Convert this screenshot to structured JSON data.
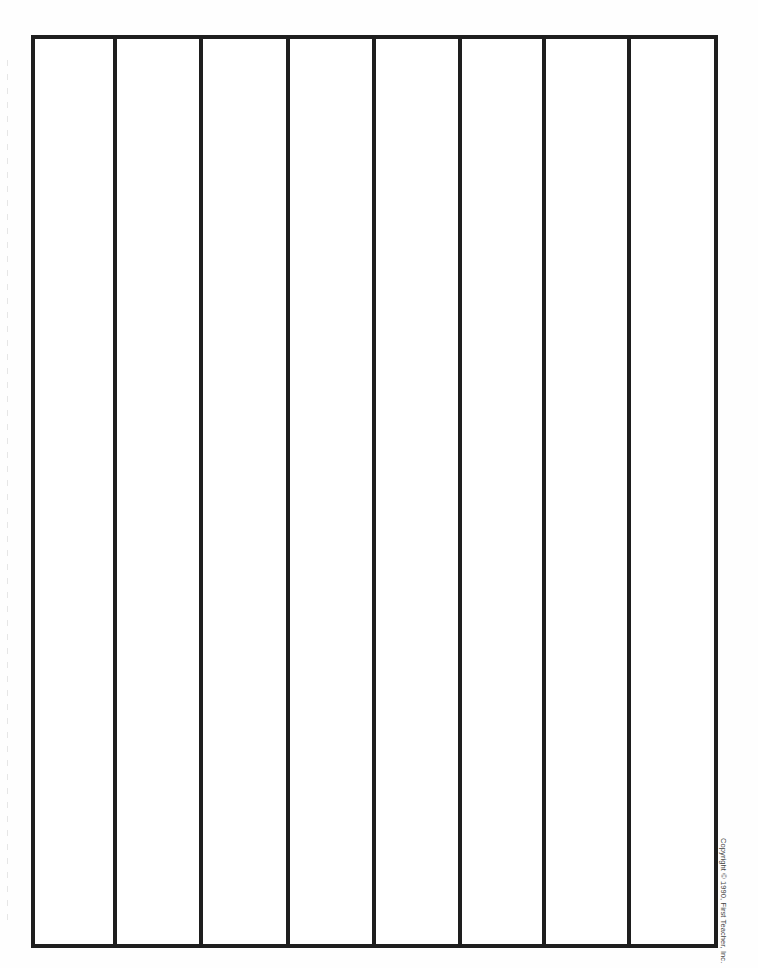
{
  "document": {
    "type": "blank columnar worksheet",
    "columns": 8,
    "line_color": "#1e1e1e",
    "background_color": "#ffffff",
    "column_divider_x": [
      117,
      203,
      290,
      376,
      462,
      546,
      631
    ]
  },
  "footer": {
    "copyright": "Copyright © 1990, First Teacher, Inc."
  }
}
